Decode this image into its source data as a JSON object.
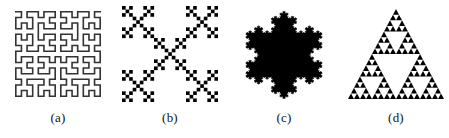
{
  "figure": {
    "background_color": "#ffffff",
    "ink_color": "#000000",
    "line_color": "#333333",
    "panels": [
      {
        "id": "a",
        "caption": "(a)",
        "fractal_name": "hilbert-curve",
        "shape_kind": "line-curve",
        "order": 4,
        "box": {
          "x": 16,
          "y": 9,
          "width": 92,
          "height": 94
        },
        "stroke_width": 1.6,
        "color": "#333333"
      },
      {
        "id": "b",
        "caption": "(b)",
        "fractal_name": "vicsek-fractal-saltire",
        "shape_kind": "filled-squares",
        "order": 3,
        "box": {
          "x": 131,
          "y": 9,
          "width": 94,
          "height": 94
        },
        "color": "#000000"
      },
      {
        "id": "c",
        "caption": "(c)",
        "fractal_name": "koch-snowflake",
        "shape_kind": "filled-polygon",
        "order": 4,
        "box": {
          "x": 244,
          "y": 10,
          "width": 96,
          "height": 92
        },
        "color": "#000000"
      },
      {
        "id": "d",
        "caption": "(d)",
        "fractal_name": "sierpinski-triangle",
        "shape_kind": "filled-polygon",
        "order": 4,
        "box": {
          "x": 352,
          "y": 10,
          "width": 96,
          "height": 92
        },
        "color": "#000000"
      }
    ]
  }
}
